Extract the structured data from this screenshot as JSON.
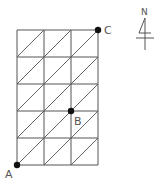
{
  "diagram": {
    "grid": {
      "columns": 3,
      "rows": 5,
      "diagonal_direction": "bottom-left to top-right",
      "line_color": "#555555"
    },
    "points": [
      {
        "label": "A",
        "position": "bottom-left corner"
      },
      {
        "label": "B",
        "position": "column line 2, row line 2 from bottom"
      },
      {
        "label": "C",
        "position": "top-right corner"
      }
    ],
    "compass": {
      "label": "N"
    }
  }
}
